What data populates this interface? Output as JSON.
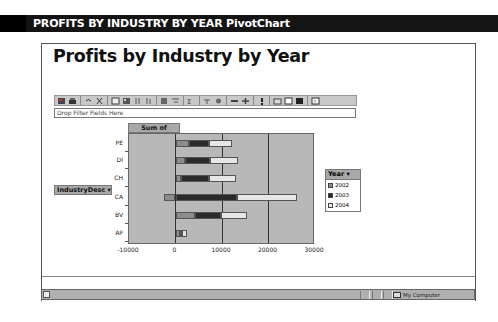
{
  "caption": {
    "text": "PROFITS BY INDUSTRY BY YEAR PivotChart"
  },
  "page": {
    "title": "Profits by Industry by Year"
  },
  "toolbar": {
    "icons": [
      "office-logo-icon",
      "print-icon",
      "undo-icon",
      "cut-icon",
      "chart-type-icon",
      "field-list-icon",
      "sort-ascending-icon",
      "sort-descending-icon",
      "autofilter-icon",
      "show-top-bottom-icon",
      "autocalc-icon",
      "subtotal-icon",
      "calculated-fields-icon",
      "collapse-icon",
      "expand-icon",
      "refresh-icon",
      "export-icon",
      "field-list-toggle-icon",
      "properties-icon",
      "help-icon"
    ]
  },
  "filter": {
    "placeholder": "Drop Filter Fields Here"
  },
  "data_field": {
    "label": "Sum of Profits"
  },
  "row_field": {
    "label": "IndustryDesc",
    "dropdown": "▾"
  },
  "legend": {
    "title": "Year",
    "dropdown": "▾",
    "items": [
      {
        "label": "2002",
        "color": "#8c8c8c"
      },
      {
        "label": "2003",
        "color": "#2a2a2a"
      },
      {
        "label": "2004",
        "color": "#e6e6e6"
      }
    ]
  },
  "status": {
    "zone": "My Computer"
  },
  "chart_data": {
    "type": "bar",
    "orientation": "horizontal",
    "stacked": true,
    "title": "Sum of Profits",
    "xlabel": "",
    "ylabel": "IndustryDesc",
    "categories": [
      "PE",
      "DI",
      "CH",
      "CA",
      "BV",
      "AP"
    ],
    "series": [
      {
        "name": "2002",
        "color": "#8c8c8c",
        "values": [
          3000,
          2000,
          1200,
          -2400,
          4200,
          900
        ]
      },
      {
        "name": "2003",
        "color": "#2a2a2a",
        "values": [
          4300,
          5500,
          6100,
          13200,
          5600,
          500
        ]
      },
      {
        "name": "2004",
        "color": "#e6e6e6",
        "values": [
          4800,
          5900,
          5700,
          12900,
          5600,
          1100
        ]
      }
    ],
    "x_ticks": [
      "-10000",
      "0",
      "10000",
      "20000",
      "30000"
    ],
    "xlim": [
      -10000,
      30000
    ],
    "grid": true,
    "legend_position": "right"
  }
}
